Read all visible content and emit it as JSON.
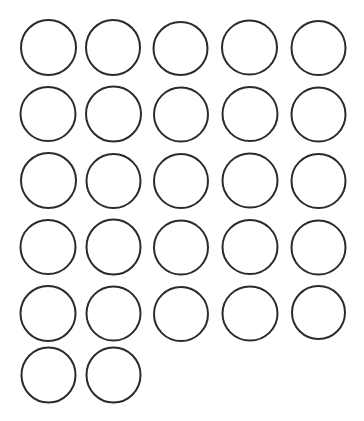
{
  "page": {
    "kind": "blank-circle-template",
    "width": 364,
    "height": 421,
    "background_color": "#ffffff"
  },
  "grid": {
    "description": "Grid of empty outlined circles arranged in rows",
    "rows": 6,
    "columns": 5,
    "total_circles": 27,
    "circle_count_per_row": [
      5,
      5,
      5,
      5,
      5,
      2
    ],
    "circle_diameter": 55,
    "stroke_color": "#2b2b2e",
    "stroke_width": 2,
    "fill_color": "#ffffff",
    "column_left_edges": [
      21,
      86,
      153,
      222,
      291
    ],
    "row_top_edges": [
      20,
      87,
      153,
      219,
      286,
      347
    ],
    "circles": [
      {
        "row": 1,
        "col": 1,
        "cx": 48.5,
        "cy": 47.5,
        "rx": 27.5,
        "ry": 27.5
      },
      {
        "row": 1,
        "col": 2,
        "cx": 113.0,
        "cy": 47.5,
        "rx": 27.0,
        "ry": 27.5
      },
      {
        "row": 1,
        "col": 3,
        "cx": 180.5,
        "cy": 48.5,
        "rx": 27.0,
        "ry": 26.5
      },
      {
        "row": 1,
        "col": 4,
        "cx": 249.5,
        "cy": 47.5,
        "rx": 27.5,
        "ry": 27.0
      },
      {
        "row": 1,
        "col": 5,
        "cx": 318.5,
        "cy": 48.0,
        "rx": 27.0,
        "ry": 27.0
      },
      {
        "row": 2,
        "col": 1,
        "cx": 48.0,
        "cy": 114.0,
        "rx": 27.5,
        "ry": 27.0
      },
      {
        "row": 2,
        "col": 2,
        "cx": 113.5,
        "cy": 114.0,
        "rx": 27.5,
        "ry": 27.5
      },
      {
        "row": 2,
        "col": 3,
        "cx": 181.0,
        "cy": 114.5,
        "rx": 27.0,
        "ry": 27.0
      },
      {
        "row": 2,
        "col": 4,
        "cx": 250.0,
        "cy": 114.0,
        "rx": 27.5,
        "ry": 27.0
      },
      {
        "row": 2,
        "col": 5,
        "cx": 318.5,
        "cy": 114.5,
        "rx": 27.0,
        "ry": 27.0
      },
      {
        "row": 3,
        "col": 1,
        "cx": 48.5,
        "cy": 180.5,
        "rx": 27.5,
        "ry": 27.5
      },
      {
        "row": 3,
        "col": 2,
        "cx": 113.5,
        "cy": 181.0,
        "rx": 27.0,
        "ry": 27.0
      },
      {
        "row": 3,
        "col": 3,
        "cx": 181.0,
        "cy": 181.0,
        "rx": 27.0,
        "ry": 27.0
      },
      {
        "row": 3,
        "col": 4,
        "cx": 250.0,
        "cy": 180.5,
        "rx": 27.5,
        "ry": 27.0
      },
      {
        "row": 3,
        "col": 5,
        "cx": 318.5,
        "cy": 181.0,
        "rx": 27.0,
        "ry": 27.0
      },
      {
        "row": 4,
        "col": 1,
        "cx": 48.0,
        "cy": 247.0,
        "rx": 27.5,
        "ry": 27.0
      },
      {
        "row": 4,
        "col": 2,
        "cx": 113.5,
        "cy": 247.0,
        "rx": 27.0,
        "ry": 27.5
      },
      {
        "row": 4,
        "col": 3,
        "cx": 181.0,
        "cy": 247.5,
        "rx": 27.0,
        "ry": 27.0
      },
      {
        "row": 4,
        "col": 4,
        "cx": 250.0,
        "cy": 247.0,
        "rx": 27.5,
        "ry": 27.0
      },
      {
        "row": 4,
        "col": 5,
        "cx": 318.5,
        "cy": 247.5,
        "rx": 27.0,
        "ry": 27.0
      },
      {
        "row": 5,
        "col": 1,
        "cx": 48.0,
        "cy": 313.5,
        "rx": 27.5,
        "ry": 27.5
      },
      {
        "row": 5,
        "col": 2,
        "cx": 113.5,
        "cy": 313.5,
        "rx": 27.0,
        "ry": 27.0
      },
      {
        "row": 5,
        "col": 3,
        "cx": 181.0,
        "cy": 314.0,
        "rx": 27.0,
        "ry": 27.0
      },
      {
        "row": 5,
        "col": 4,
        "cx": 250.0,
        "cy": 313.5,
        "rx": 27.5,
        "ry": 27.0
      },
      {
        "row": 5,
        "col": 5,
        "cx": 318.5,
        "cy": 312.5,
        "rx": 26.5,
        "ry": 26.5
      },
      {
        "row": 6,
        "col": 1,
        "cx": 48.5,
        "cy": 375.0,
        "rx": 27.0,
        "ry": 27.5
      },
      {
        "row": 6,
        "col": 2,
        "cx": 113.5,
        "cy": 375.0,
        "rx": 27.0,
        "ry": 27.5
      }
    ]
  }
}
